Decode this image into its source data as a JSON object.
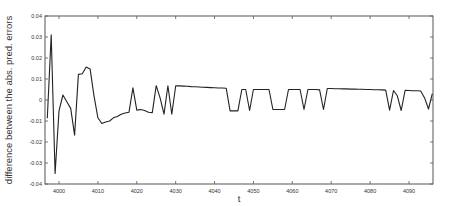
{
  "chart_data": {
    "type": "line",
    "title": "",
    "xlabel": "t",
    "ylabel": "difference between the abs. pred. errors",
    "xlim": [
      3996.5,
      4096.2
    ],
    "ylim": [
      -0.04,
      0.04
    ],
    "grid": false,
    "legend": null,
    "x_ticks": [
      4000,
      4010,
      4020,
      4030,
      4040,
      4050,
      4060,
      4070,
      4080,
      4090
    ],
    "x_tick_labels": [
      "4000",
      "4010",
      "4020",
      "4030",
      "4040",
      "4050",
      "4060",
      "4070",
      "4080",
      "4090"
    ],
    "y_ticks": [
      0.04,
      0.03,
      0.02,
      0.01,
      0,
      -0.01,
      -0.02,
      -0.03,
      -0.04
    ],
    "y_tick_labels": [
      "0.04",
      "0.03",
      "0.02",
      "0.01",
      "0",
      "-0.01",
      "-0.02",
      "-0.03",
      "-0.04"
    ],
    "line_color": "#222222",
    "series": [
      {
        "name": "difference",
        "x": [
          3997,
          3998,
          3999,
          4000,
          4001,
          4002,
          4003,
          4004,
          4005,
          4006,
          4007,
          4008,
          4009,
          4010,
          4011,
          4012,
          4013,
          4014,
          4015,
          4016,
          4017,
          4018,
          4019,
          4020,
          4021,
          4022,
          4023,
          4024,
          4025,
          4026,
          4027,
          4028,
          4029,
          4030,
          4031,
          4032,
          4033,
          4034,
          4035,
          4036,
          4037,
          4038,
          4039,
          4040,
          4041,
          4042,
          4043,
          4044,
          4045,
          4046,
          4047,
          4048,
          4049,
          4050,
          4051,
          4052,
          4053,
          4054,
          4055,
          4056,
          4057,
          4058,
          4059,
          4060,
          4061,
          4062,
          4063,
          4064,
          4065,
          4066,
          4067,
          4068,
          4069,
          4070,
          4071,
          4072,
          4073,
          4074,
          4075,
          4076,
          4077,
          4078,
          4079,
          4080,
          4081,
          4082,
          4083,
          4084,
          4085,
          4086,
          4087,
          4088,
          4089,
          4090,
          4091,
          4092,
          4093,
          4094,
          4095,
          4096
        ],
        "values": [
          -0.0087,
          0.031,
          -0.035,
          -0.0052,
          0.0024,
          -0.0008,
          -0.004,
          -0.0167,
          0.0122,
          0.0125,
          0.0157,
          0.0148,
          0.002,
          -0.0085,
          -0.0112,
          -0.0105,
          -0.01,
          -0.0085,
          -0.0078,
          -0.0068,
          -0.0062,
          -0.0058,
          0.0058,
          -0.0048,
          -0.0045,
          -0.005,
          -0.0058,
          -0.006,
          0.0068,
          0.001,
          -0.0067,
          0.0068,
          -0.0068,
          0.0068,
          0.0067,
          0.0066,
          0.0065,
          0.0064,
          0.0063,
          0.0062,
          0.0061,
          0.006,
          0.0059,
          0.0058,
          0.0057,
          0.0057,
          0.0056,
          -0.0052,
          -0.0052,
          -0.0052,
          0.005,
          0.005,
          -0.005,
          0.005,
          0.005,
          0.005,
          0.005,
          0.005,
          -0.0045,
          -0.0045,
          -0.0045,
          -0.0045,
          0.005,
          0.005,
          0.005,
          0.005,
          -0.0045,
          0.005,
          0.005,
          0.005,
          0.0048,
          -0.0045,
          0.0055,
          0.0055,
          0.0054,
          0.0054,
          0.0053,
          0.0053,
          0.0052,
          0.0052,
          0.0051,
          0.0051,
          0.005,
          0.005,
          0.0049,
          0.0049,
          0.0048,
          0.0047,
          -0.0048,
          0.0045,
          0.002,
          -0.005,
          0.0046,
          0.0045,
          0.0044,
          0.0044,
          0.0043,
          0.001,
          -0.0043,
          0.003
        ]
      }
    ]
  }
}
